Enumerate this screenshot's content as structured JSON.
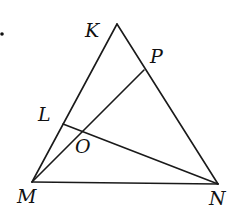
{
  "diagram": {
    "type": "geometry-triangle",
    "background": "#ffffff",
    "stroke_color": "#1a1a1a",
    "points": {
      "K": {
        "x": 117,
        "y": 24
      },
      "P": {
        "x": 144,
        "y": 70
      },
      "L": {
        "x": 63,
        "y": 124
      },
      "O": {
        "x": 82,
        "y": 131
      },
      "M": {
        "x": 32,
        "y": 182
      },
      "N": {
        "x": 218,
        "y": 184
      }
    },
    "segments": [
      {
        "name": "KM",
        "from": "K",
        "to": "M"
      },
      {
        "name": "KN",
        "from": "K",
        "to": "N"
      },
      {
        "name": "MN",
        "from": "M",
        "to": "N"
      },
      {
        "name": "MP",
        "from": "M",
        "to": "P"
      },
      {
        "name": "LN",
        "from": "L",
        "to": "N"
      }
    ],
    "labels": {
      "K": "K",
      "P": "P",
      "L": "L",
      "O": "O",
      "M": "M",
      "N": "N"
    },
    "bullet": "•"
  }
}
